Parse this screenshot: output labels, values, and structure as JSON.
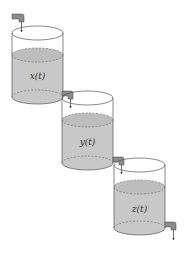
{
  "diagram": {
    "type": "cascading-tanks",
    "colors": {
      "water": "#c8c8c8",
      "water_surface": "#bdbdbd",
      "outline": "#555555",
      "tap": "#8c8c8c",
      "background": "#ffffff"
    },
    "tanks": [
      {
        "label": "x(t)"
      },
      {
        "label": "y(t)"
      },
      {
        "label": "z(t)"
      }
    ]
  }
}
